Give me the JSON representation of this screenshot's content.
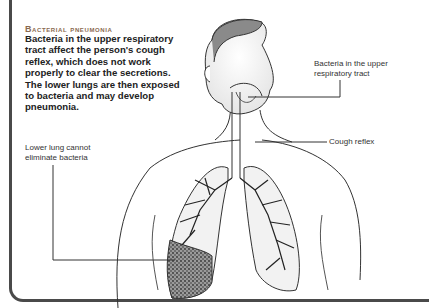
{
  "heading": "Bacterial pneumonia",
  "description": "Bacteria in the upper respiratory tract affect the person's cough reflex, which does not work properly to clear the secretions. The lower lungs are then exposed to bacteria and may develop pneumonia.",
  "labels": {
    "upper_tract": "Bacteria in the upper respiratory tract",
    "cough_reflex": "Cough reflex",
    "lower_lung": "Lower lung cannot eliminate bacteria"
  },
  "illustration": {
    "subject": "human head and torso with respiratory tract and lungs",
    "colors": {
      "line": "#333333",
      "frame": "#4a4a4a",
      "heading": "#8a6a50",
      "infected": "#555555"
    }
  }
}
